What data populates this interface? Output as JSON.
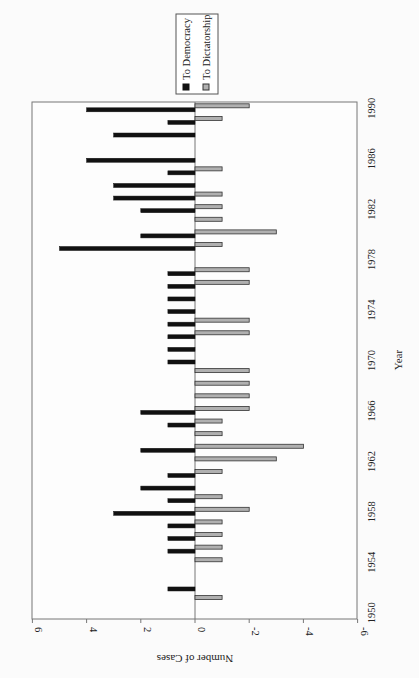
{
  "chart_data": {
    "type": "bar",
    "orientation": "rotated 90deg clockwise (year axis on right, value axis along bottom, reversed)",
    "title": "",
    "xlabel": "Year",
    "ylabel": "Number of Cases",
    "ylim": [
      -6,
      6
    ],
    "yticks": [
      "6",
      "4",
      "2",
      "0",
      "-2",
      "-4",
      "-6"
    ],
    "xtick_labels": [
      "1950",
      "1954",
      "1958",
      "1962",
      "1966",
      "1970",
      "1974",
      "1978",
      "1982",
      "1986",
      "1990"
    ],
    "grid": false,
    "legend_position": "top",
    "categories": [
      1950,
      1951,
      1952,
      1953,
      1954,
      1955,
      1956,
      1957,
      1958,
      1959,
      1960,
      1961,
      1962,
      1963,
      1964,
      1965,
      1966,
      1967,
      1968,
      1969,
      1970,
      1971,
      1972,
      1973,
      1974,
      1975,
      1976,
      1977,
      1978,
      1979,
      1980,
      1981,
      1982,
      1983,
      1984,
      1985,
      1986,
      1987,
      1988,
      1989,
      1990
    ],
    "series": [
      {
        "name": "To Democracy",
        "color": "#111111",
        "values": [
          0,
          0,
          1,
          0,
          0,
          1,
          1,
          1,
          3,
          1,
          2,
          1,
          0,
          2,
          0,
          1,
          2,
          0,
          0,
          0,
          1,
          1,
          1,
          1,
          1,
          1,
          1,
          1,
          0,
          5,
          2,
          0,
          2,
          3,
          3,
          1,
          4,
          0,
          3,
          1,
          4
        ]
      },
      {
        "name": "To Dictatorship",
        "color": "#b0b0b0",
        "values": [
          0,
          -1,
          0,
          0,
          -1,
          -1,
          -1,
          -1,
          -2,
          -1,
          0,
          -1,
          -3,
          -4,
          -1,
          -1,
          -2,
          -2,
          -2,
          -2,
          0,
          0,
          -2,
          -2,
          0,
          0,
          -2,
          -2,
          0,
          -1,
          -3,
          -1,
          -1,
          -1,
          0,
          -1,
          0,
          0,
          0,
          -1,
          -2
        ]
      }
    ]
  },
  "legend": {
    "items": [
      {
        "label": "To Democracy",
        "color": "#111111"
      },
      {
        "label": "To Dictatorship",
        "color": "#b0b0b0"
      }
    ]
  },
  "axes": {
    "value_axis_title": "Number of Cases",
    "category_axis_title": "Year"
  }
}
